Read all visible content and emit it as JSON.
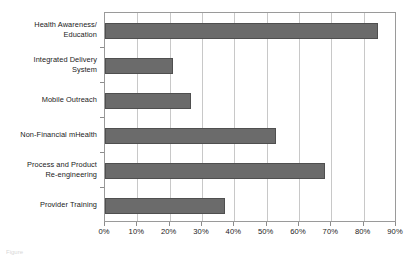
{
  "chart_data": {
    "type": "bar",
    "orientation": "horizontal",
    "title": "",
    "xlabel": "",
    "ylabel": "",
    "categories": [
      "Health Awareness/\nEducation",
      "Integrated Delivery\nSystem",
      "Mobile Outreach",
      "Non-Financial mHealth",
      "Process and Product\nRe-engineering",
      "Provider Training"
    ],
    "values": [
      84.5,
      21.0,
      26.5,
      53.0,
      68.0,
      37.0
    ],
    "value_unit": "%",
    "xlim": [
      0,
      90
    ],
    "xticks": [
      0,
      10,
      20,
      30,
      40,
      50,
      60,
      70,
      80,
      90
    ],
    "xtick_labels": [
      "0%",
      "10%",
      "20%",
      "30%",
      "40%",
      "50%",
      "60%",
      "70%",
      "80%",
      "90%"
    ],
    "grid": "vertical",
    "legend": "none",
    "bar_color": "#6b6b6b",
    "bar_edge_color": "#4f4f4f",
    "gridline_color": "#c8c8c8",
    "axis_color": "#9a9a9a",
    "background": "#ffffff"
  },
  "caption": {
    "fragment": "Figure"
  }
}
